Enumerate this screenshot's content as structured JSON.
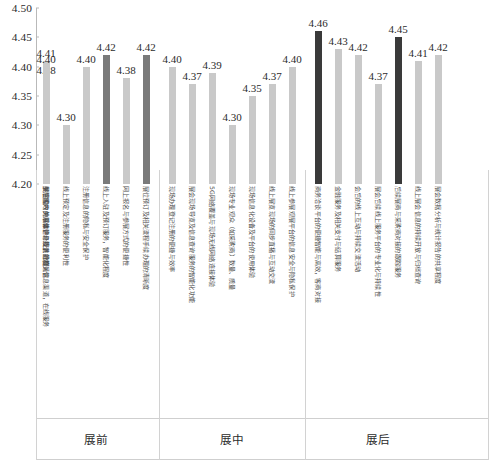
{
  "chart_data": {
    "type": "bar",
    "title": "",
    "xlabel": "",
    "ylabel": "",
    "ylim": [
      4.2,
      4.5
    ],
    "ytick_step": 0.05,
    "ytick_labels": [
      "4.50",
      "4.45",
      "4.40",
      "4.35",
      "4.30",
      "4.25",
      "4.20"
    ],
    "ytick_values": [
      4.5,
      4.45,
      4.4,
      4.35,
      4.3,
      4.25,
      4.2
    ],
    "grid": false,
    "legend": "none",
    "group_labels": [
      "展前",
      "展中",
      "展后"
    ],
    "group_sizes": [
      6,
      7,
      7
    ],
    "categories": [
      "关注国内外展会信息提供的相关信息渠道，在线服务",
      "线上预定及注册服务的便利性",
      "注册信息的隐私与安全保护",
      "线上入驻及预订服务，智能化程度",
      "网上报名与参展方式的便捷性",
      "展位预订及相关流程手续办理的清晰度",
      "现场办理登记注册的便捷与效率",
      "展会现场导览及信息查询服务的智能化功能",
      "5G网络覆盖与现场无线网络连接体验",
      "现场专业观众（如采购商）数量、质量",
      "现场信息化设备及平台的使用体验",
      "线上展览现场的同步直播与互动交流",
      "线上参展观展平台的信息安全与隐私保护",
      "商务洽谈平台的便捷智能与高效，客商对接",
      "金融服务及相关支付与结算服务",
      "会后的线上互动与持续交流活动",
      "展会后续线上服务平台的专业化与持续性",
      "后续展商与采购商对接的跟踪服务",
      "线上展会信息的持续开放与归档查询",
      "展会数据分析与统计报告的共享程度",
      "展后客户关系维护与线上社群运营",
      "参展成效的总体评价及满意度"
    ],
    "bars": [
      {
        "group": "展前",
        "value": 4.41,
        "label": "4.41",
        "highlight": "none",
        "category": "关注国内外展会信息提供的相关信息渠道，在线服务"
      },
      {
        "group": "展前",
        "value": 4.3,
        "label": "4.30",
        "highlight": "none",
        "category": "线上预定及注册服务的便利性"
      },
      {
        "group": "展前",
        "value": 4.4,
        "label": "4.40",
        "highlight": "none",
        "category": "注册信息的隐私与安全保护"
      },
      {
        "group": "展前",
        "value": 4.42,
        "label": "4.42",
        "highlight": "mid",
        "category": "线上入驻及预订服务，智能化程度"
      },
      {
        "group": "展前",
        "value": 4.38,
        "label": "4.38",
        "highlight": "none",
        "category": "网上报名与参展方式的便捷性"
      },
      {
        "group": "展前",
        "value": 4.42,
        "label": "4.42",
        "highlight": "mid",
        "category": "展位预订及相关流程手续办理的清晰度"
      },
      {
        "group": "展中",
        "value": 4.4,
        "label": "4.40",
        "highlight": "none",
        "category": "现场办理登记注册的便捷与效率"
      },
      {
        "group": "展中",
        "value": 4.37,
        "label": "4.37",
        "highlight": "none",
        "category": "展会现场导览及信息查询服务的智能化功能"
      },
      {
        "group": "展中",
        "value": 4.39,
        "label": "4.39",
        "highlight": "none",
        "category": "5G网络覆盖与现场无线网络连接体验"
      },
      {
        "group": "展中",
        "value": 4.3,
        "label": "4.30",
        "highlight": "none",
        "category": "现场专业观众（如采购商）数量、质量"
      },
      {
        "group": "展中",
        "value": 4.35,
        "label": "4.35",
        "highlight": "none",
        "category": "现场信息化设备及平台的使用体验"
      },
      {
        "group": "展中",
        "value": 4.37,
        "label": "4.37",
        "highlight": "none",
        "category": "线上展览现场的同步直播与互动交流"
      },
      {
        "group": "展中",
        "value": 4.4,
        "label": "4.40",
        "highlight": "none",
        "category": "线上参展观展平台的信息安全与隐私保护"
      },
      {
        "group": "展中",
        "value": 4.46,
        "label": "4.46",
        "highlight": "dark",
        "category": "商务洽谈平台的便捷智能与高效，客商对接"
      },
      {
        "group": "展后",
        "value": 4.43,
        "label": "4.43",
        "highlight": "none",
        "category": "金融服务及相关支付与结算服务"
      },
      {
        "group": "展后",
        "value": 4.42,
        "label": "4.42",
        "highlight": "none",
        "category": "会后的线上互动与持续交流活动"
      },
      {
        "group": "展后",
        "value": 4.37,
        "label": "4.37",
        "highlight": "none",
        "category": "展会后续线上服务平台的专业化与持续性"
      },
      {
        "group": "展后",
        "value": 4.45,
        "label": "4.45",
        "highlight": "dark",
        "category": "后续展商与采购商对接的跟踪服务"
      },
      {
        "group": "展后",
        "value": 4.41,
        "label": "4.41",
        "highlight": "none",
        "category": "线上展会信息的持续开放与归档查询"
      },
      {
        "group": "展后",
        "value": 4.42,
        "label": "4.42",
        "highlight": "none",
        "category": "展会数据分析与统计报告的共享程度"
      },
      {
        "group": "展后",
        "value": 4.38,
        "label": "4.38",
        "highlight": "none",
        "category": "展后客户关系维护与线上社群运营"
      },
      {
        "group": "展后",
        "value": 4.4,
        "label": "4.40",
        "highlight": "none",
        "category": "参展成效的总体评价及满意度"
      }
    ],
    "colors": {
      "bar_default": "#c9c9c9",
      "bar_highlight_mid": "#7a7a7a",
      "bar_highlight_dark": "#3a3a3a",
      "axis": "#b9b9b9",
      "text": "#2b2b2b"
    }
  }
}
